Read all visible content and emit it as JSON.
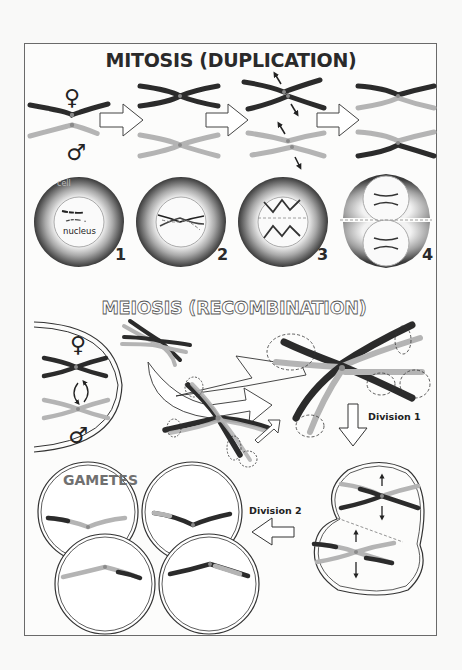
{
  "mitosis": {
    "title": "MITOSIS (DUPLICATION)",
    "female_symbol": "♀",
    "male_symbol": "♂",
    "cell_label": "cell",
    "nucleus_label": "nucleus",
    "stages": [
      {
        "number": "1"
      },
      {
        "number": "2"
      },
      {
        "number": "3"
      },
      {
        "number": "4"
      }
    ]
  },
  "meiosis": {
    "title": "MEIOSIS (RECOMBINATION)",
    "female_symbol": "♀",
    "male_symbol": "♂",
    "division1_label": "Division 1",
    "division2_label": "Division 2",
    "gametes_label": "GAMETES"
  },
  "colors": {
    "background": "#f9f9f8",
    "frame": "#6a6a6a",
    "maternal_chromosome": "#2b2b2b",
    "paternal_chromosome": "#b4b4b4",
    "centromere": "#8a8a8a",
    "cell_dark": "#3c3c3c",
    "cell_light": "#e8e8e8"
  }
}
